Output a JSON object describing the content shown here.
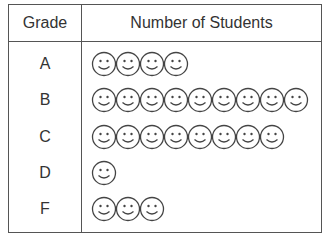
{
  "chart_data": {
    "type": "table",
    "subtype": "pictograph",
    "columns": [
      "Grade",
      "Number of Students"
    ],
    "categories": [
      "A",
      "B",
      "C",
      "D",
      "F"
    ],
    "values": [
      4,
      9,
      8,
      1,
      3
    ],
    "symbol": "smiley-face",
    "symbol_value": 1
  },
  "header": {
    "grade": "Grade",
    "count": "Number of Students"
  },
  "rows": [
    {
      "grade": "A",
      "count": 4
    },
    {
      "grade": "B",
      "count": 9
    },
    {
      "grade": "C",
      "count": 8
    },
    {
      "grade": "D",
      "count": 1
    },
    {
      "grade": "F",
      "count": 3
    }
  ],
  "colors": {
    "line": "#555555",
    "text": "#333333",
    "face_stroke": "#444444"
  }
}
